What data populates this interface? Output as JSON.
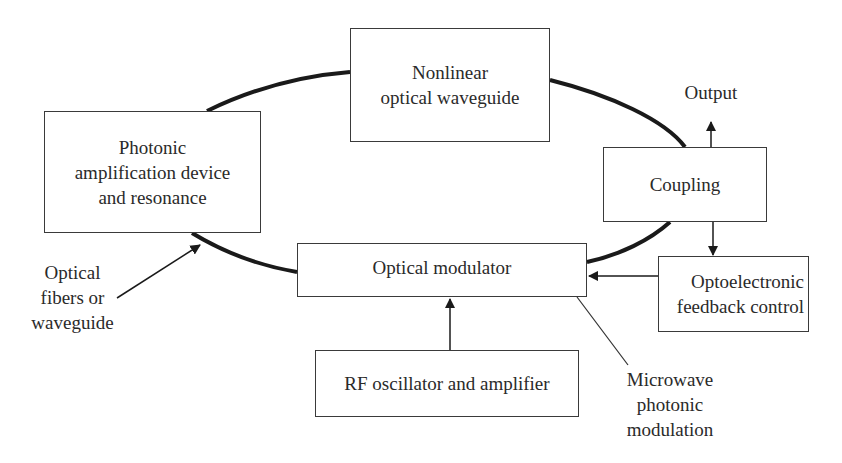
{
  "diagram": {
    "type": "block-diagram",
    "nodes": {
      "photonic": {
        "lines": [
          "Photonic",
          "amplification device",
          "and resonance"
        ]
      },
      "nonlinear": {
        "lines": [
          "Nonlinear",
          "optical waveguide"
        ]
      },
      "coupling": {
        "lines": [
          "Coupling"
        ]
      },
      "optoelectronic": {
        "lines": [
          "Optoelectronic",
          "feedback control"
        ]
      },
      "modulator": {
        "lines": [
          "Optical modulator"
        ]
      },
      "rf": {
        "lines": [
          "RF oscillator and amplifier"
        ]
      }
    },
    "annotations": {
      "output": {
        "lines": [
          "Output"
        ]
      },
      "fibers": {
        "lines": [
          "Optical",
          "fibers or",
          "waveguide"
        ]
      },
      "microwave": {
        "lines": [
          "Microwave",
          "photonic",
          "modulation"
        ]
      }
    },
    "edges": [
      {
        "from": "photonic",
        "to": "nonlinear",
        "style": "thick-loop"
      },
      {
        "from": "nonlinear",
        "to": "coupling",
        "style": "thick-loop"
      },
      {
        "from": "coupling",
        "to": "modulator",
        "style": "thick-loop"
      },
      {
        "from": "modulator",
        "to": "photonic",
        "style": "thick-loop"
      },
      {
        "from": "coupling",
        "to": "output",
        "style": "arrow"
      },
      {
        "from": "coupling",
        "to": "optoelectronic",
        "style": "arrow"
      },
      {
        "from": "optoelectronic",
        "to": "modulator",
        "style": "arrow"
      },
      {
        "from": "rf",
        "to": "modulator",
        "style": "arrow"
      },
      {
        "from": "fibers",
        "to": "photonic-loop",
        "style": "arrow"
      },
      {
        "from": "microwave",
        "to": "modulator",
        "style": "leader-line"
      }
    ],
    "colors": {
      "line": "#1a1a1a",
      "box_border": "#3a3a3a",
      "text": "#2a2a2a",
      "background": "#ffffff"
    }
  }
}
